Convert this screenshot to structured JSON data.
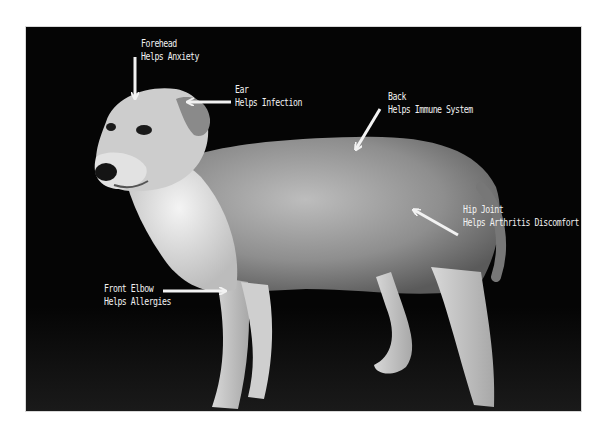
{
  "image": {
    "subject": "dog",
    "style": "grayscale photo on black background",
    "background_color": "#050505",
    "label_color": "#f2f2f2"
  },
  "annotations": [
    {
      "id": "forehead",
      "part": "Forehead",
      "benefit": "Helps Anxiety"
    },
    {
      "id": "ear",
      "part": "Ear",
      "benefit": "Helps Infection"
    },
    {
      "id": "back",
      "part": "Back",
      "benefit": "Helps Immune System"
    },
    {
      "id": "hip",
      "part": "Hip Joint",
      "benefit": "Helps Arthritis Discomfort"
    },
    {
      "id": "elbow",
      "part": "Front Elbow",
      "benefit": "Helps Allergies"
    }
  ]
}
